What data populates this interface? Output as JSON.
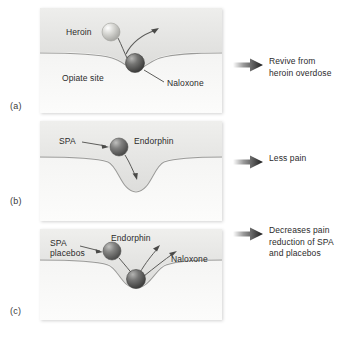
{
  "figure": {
    "caption": "",
    "background_color": "#ffffff",
    "panel_fill_top": "#f1f1f0",
    "panel_fill_bottom": "#fbfbfa",
    "membrane_line_color": "#9a9a9a",
    "text_color": "#2b2b2b"
  },
  "panels": [
    {
      "tag": "(a)",
      "labels": {
        "ligand": "Heroin",
        "site": "Opiate site",
        "blocker": "Naloxone"
      },
      "molecules": [
        {
          "name": "Heroin",
          "color": "#cfcfcc",
          "state": "displaced"
        },
        {
          "name": "Naloxone",
          "color": "#6e6e6e",
          "state": "bound"
        }
      ],
      "outcome": "Revive from\nheroin overdose"
    },
    {
      "tag": "(b)",
      "labels": {
        "stimulus": "SPA",
        "ligand": "Endorphin"
      },
      "molecules": [
        {
          "name": "Endorphin",
          "color": "#787878",
          "state": "entering"
        }
      ],
      "outcome": "Less pain"
    },
    {
      "tag": "(c)",
      "labels": {
        "stimulus": "SPA\nplacebos",
        "ligand": "Endorphin",
        "blocker": "Naloxone"
      },
      "molecules": [
        {
          "name": "Endorphin",
          "color": "#7a7a7a",
          "state": "displaced"
        },
        {
          "name": "Naloxone",
          "color": "#6a6a6a",
          "state": "bound"
        }
      ],
      "outcome": "Decreases pain\nreduction of SPA\nand placebos"
    }
  ]
}
